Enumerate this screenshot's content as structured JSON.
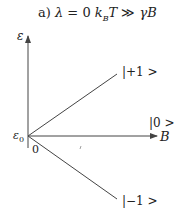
{
  "title": {
    "prefix": "a) ",
    "lambda": "λ",
    "eq": " = 0 ",
    "k": "k",
    "sub": "B",
    "T": "T",
    "gg": " ≫ ",
    "gamma": "γ",
    "B": "B"
  },
  "axes": {
    "y_label": "ε",
    "x_label": "B",
    "origin_label": "ε",
    "origin_sub": "0",
    "zero_label": "0"
  },
  "states": [
    {
      "label": "|+1 >",
      "slope": "positive"
    },
    {
      "label": "|0 >",
      "slope": "zero"
    },
    {
      "label": "|−1 >",
      "slope": "negative"
    }
  ],
  "colors": {
    "line": "#444444",
    "text": "#222222"
  }
}
